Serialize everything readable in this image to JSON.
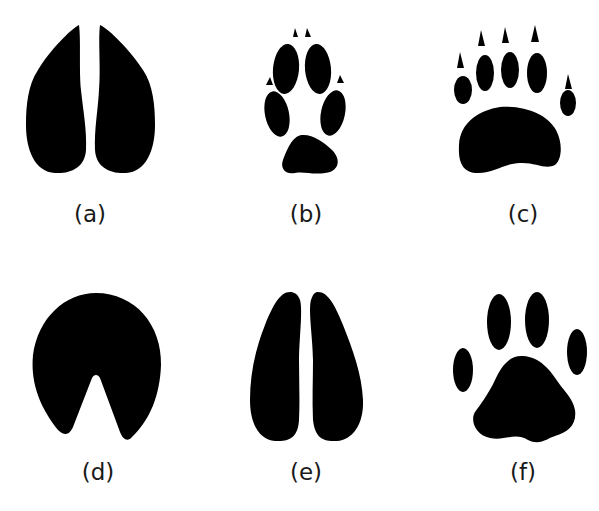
{
  "figure": {
    "ink_color": "#000000",
    "background": "#ffffff",
    "panels": [
      {
        "id": "a",
        "label": "(a)",
        "track": "two-toed hoof, pointed tips"
      },
      {
        "id": "b",
        "label": "(b)",
        "track": "canine paw with claws"
      },
      {
        "id": "c",
        "label": "(c)",
        "track": "bear paw with claws"
      },
      {
        "id": "d",
        "label": "(d)",
        "track": "horse hoof"
      },
      {
        "id": "e",
        "label": "(e)",
        "track": "two-toed hoof, rounded tips"
      },
      {
        "id": "f",
        "label": "(f)",
        "track": "feline paw"
      }
    ]
  }
}
